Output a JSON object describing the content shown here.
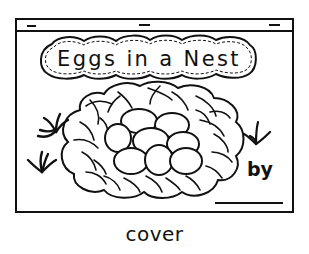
{
  "cover": {
    "title": "Eggs in a Nest",
    "author_label": "by",
    "author_line": "",
    "caption": "cover"
  },
  "illustration": {
    "subjects": [
      "nest-icon",
      "egg-icon",
      "grass-icon"
    ],
    "egg_count": 8,
    "grass_tuft_count": 3
  },
  "colors": {
    "ink": "#111111",
    "paper": "#ffffff"
  }
}
